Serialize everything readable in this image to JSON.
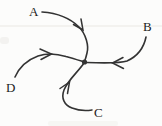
{
  "diagram": {
    "labels": {
      "a": "A",
      "b": "B",
      "c": "C",
      "d": "D"
    },
    "colors": {
      "stroke": "#333333",
      "label": "#222222",
      "background": "#fcfcfb",
      "faint_rule": "#e9e8e3"
    }
  }
}
